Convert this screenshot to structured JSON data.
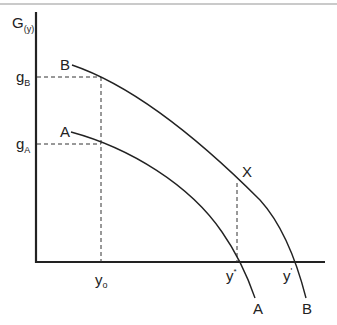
{
  "diagram": {
    "y_axis_label": {
      "main": "G",
      "sub": "(y)"
    },
    "x_axis_labels": {
      "y0": {
        "main": "y",
        "sub": "o"
      },
      "y_star": {
        "main": "y",
        "sup": "*"
      },
      "y_prime": {
        "main": "y",
        "sup": "'"
      }
    },
    "y_tick_labels": {
      "gB": {
        "main": "g",
        "sub": "B"
      },
      "gA": {
        "main": "g",
        "sub": "A"
      }
    },
    "curves": {
      "A": {
        "label_top": "A",
        "label_bottom": "A"
      },
      "B": {
        "label_top": "B",
        "label_bottom": "B"
      }
    },
    "point_x_label": "X",
    "colors": {
      "line": "#222222",
      "top_rule": "#b0b0b0",
      "background": "#ffffff"
    }
  }
}
